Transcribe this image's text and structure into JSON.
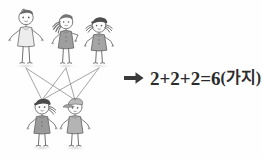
{
  "background_color": "#fefefe",
  "illustration": {
    "title_alt": "stick figure matching diagram",
    "line_color": "#8f8f8f",
    "outline_color": "#6e6e6e",
    "top_row": {
      "label": "top-row-figures",
      "count": 3,
      "figures": [
        {
          "id": "figure-top-1",
          "name": "boy-plain-light-shirt",
          "hair": "short-dark",
          "garment": "dress-light",
          "garment_color": "#ededed",
          "skin_color": "#fbfbfb"
        },
        {
          "id": "figure-top-2",
          "name": "girl-side-ponytail-gray-dress",
          "hair": "side-ponytail-dark",
          "garment": "dress-medium-gray",
          "garment_color": "#9e9e9e",
          "skin_color": "#fbfbfb"
        },
        {
          "id": "figure-top-3",
          "name": "girl-pigtails-gray-dress",
          "hair": "pigtails-dark",
          "garment": "dress-medium-gray",
          "garment_color": "#a5a5a5",
          "skin_color": "#fbfbfb"
        }
      ]
    },
    "bottom_row": {
      "label": "bottom-row-figures",
      "count": 2,
      "figures": [
        {
          "id": "figure-bottom-1",
          "name": "girl-ponytail-gray-dress",
          "hair": "ponytail-dark",
          "garment": "dress-medium-gray",
          "garment_color": "#9a9a9a",
          "skin_color": "#fbfbfb"
        },
        {
          "id": "figure-bottom-2",
          "name": "boy-with-cap-light-shirt",
          "hair": "cap-gray",
          "garment": "shirt-light-gray",
          "garment_color": "#b4b4b4",
          "skin_color": "#fbfbfb"
        }
      ]
    },
    "connections": {
      "label": "matching-lines",
      "description": "each of the 3 top figures is joined to each of the 2 bottom figures",
      "count": 6,
      "pairs": [
        [
          1,
          1
        ],
        [
          1,
          2
        ],
        [
          2,
          1
        ],
        [
          2,
          2
        ],
        [
          3,
          1
        ],
        [
          3,
          2
        ]
      ]
    }
  },
  "result": {
    "arrow_icon": "arrow-right-icon",
    "arrow_color": "#3a3a3a",
    "equation": "2+2+2=6",
    "unit": "(가지)",
    "text_color": "#2b2b2b"
  }
}
